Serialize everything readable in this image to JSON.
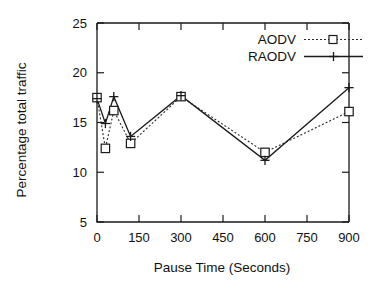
{
  "chart_data": {
    "type": "line",
    "title": "",
    "xlabel": "Pause Time (Seconds)",
    "ylabel": "Percentage total traffic",
    "x": [
      0,
      30,
      60,
      120,
      300,
      600,
      900
    ],
    "xlim": [
      0,
      900
    ],
    "ylim": [
      5,
      25
    ],
    "xticks": [
      0,
      150,
      300,
      450,
      600,
      750,
      900
    ],
    "yticks": [
      5,
      10,
      15,
      20,
      25
    ],
    "xticklabels": [
      "0",
      "150",
      "300",
      "450",
      "600",
      "750",
      "900"
    ],
    "yticklabels": [
      "5",
      "10",
      "15",
      "20",
      "25"
    ],
    "grid": false,
    "legend_position": "top-right",
    "series": [
      {
        "name": "AODV",
        "marker": "square",
        "linestyle": "dotted",
        "color": "#2b2b2b",
        "values": [
          17.5,
          12.4,
          16.2,
          12.9,
          17.6,
          12.0,
          16.1
        ]
      },
      {
        "name": "RAODV",
        "marker": "plus",
        "linestyle": "solid",
        "color": "#1a1a1a",
        "values": [
          17.4,
          14.9,
          17.6,
          13.6,
          17.7,
          11.2,
          18.5
        ]
      }
    ]
  },
  "legend": {
    "entries": [
      {
        "label": "AODV"
      },
      {
        "label": "RAODV"
      }
    ]
  },
  "axes": {
    "x_title": "Pause Time (Seconds)",
    "y_title": "Percentage total traffic"
  }
}
